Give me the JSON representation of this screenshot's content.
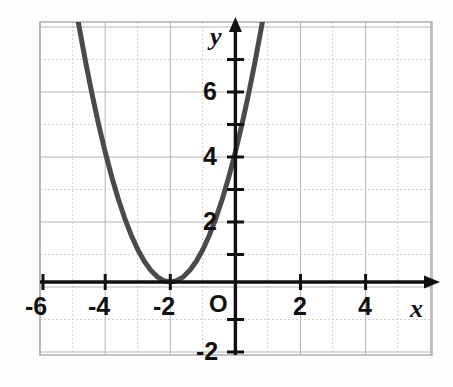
{
  "chart_data": {
    "type": "line",
    "title": "",
    "subtitle": "",
    "xlabel": "x",
    "ylabel": "y",
    "xlim": [
      -6,
      6
    ],
    "ylim": [
      -2,
      8
    ],
    "grid": true,
    "grid_step": 0.5,
    "legend": "none",
    "origin_label": "O",
    "x_ticks": [
      -6,
      -4,
      -2,
      2,
      4
    ],
    "x_tick_labels": [
      "-6",
      "-4",
      "-2",
      "2",
      "4"
    ],
    "y_ticks": [
      -2,
      2,
      4,
      6
    ],
    "y_tick_labels": [
      "-2",
      "2",
      "4",
      "6"
    ],
    "series": [
      {
        "name": "parabola",
        "equation": "y = (x + 2)^2",
        "vertex": [
          -2,
          0
        ],
        "color": "#4a4a4a",
        "linewidth": 5,
        "x": [
          -4.85,
          -4.6,
          -4.4,
          -4.2,
          -4.0,
          -3.8,
          -3.6,
          -3.4,
          -3.2,
          -3.0,
          -2.8,
          -2.6,
          -2.4,
          -2.2,
          -2.0,
          -1.8,
          -1.6,
          -1.4,
          -1.2,
          -1.0,
          -0.8,
          -0.6,
          -0.4,
          -0.2,
          0.0,
          0.2,
          0.4,
          0.6,
          0.8,
          0.85
        ],
        "y": [
          8.12,
          6.76,
          5.76,
          4.84,
          4.0,
          3.24,
          2.56,
          1.96,
          1.44,
          1.0,
          0.64,
          0.36,
          0.16,
          0.04,
          0.0,
          0.04,
          0.16,
          0.36,
          0.64,
          1.0,
          1.44,
          1.96,
          2.56,
          3.24,
          4.0,
          4.84,
          5.76,
          6.76,
          7.84,
          8.12
        ]
      }
    ],
    "key_points": [
      {
        "label": "vertex",
        "x": -2,
        "y": 0
      },
      {
        "label": "y-intercept",
        "x": 0,
        "y": 4
      },
      {
        "label": "symmetric-point",
        "x": -4,
        "y": 4
      }
    ]
  },
  "axes": {
    "x_axis_name": "x",
    "y_axis_name": "y",
    "origin": "O"
  },
  "labels": {
    "x_neg6": "-6",
    "x_neg4": "-4",
    "x_neg2": "-2",
    "x_pos2": "2",
    "x_pos4": "4",
    "y_6": "6",
    "y_4": "4",
    "y_2": "2",
    "y_neg2": "-2"
  },
  "colors": {
    "curve": "#4a4a4a",
    "axis": "#111111",
    "grid_major": "#b9b9b9",
    "grid_minor": "#d0d0d0",
    "background": "#fdfdfc",
    "text": "#111111"
  }
}
